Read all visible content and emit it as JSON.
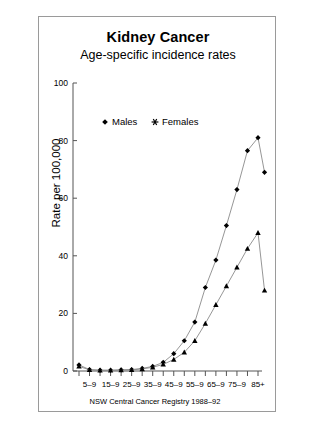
{
  "figure": {
    "title": "Kidney Cancer",
    "subtitle": "Age-specific incidence rates",
    "ylabel": "Rate per 100,000",
    "source_note": "NSW Central Cancer Registry 1988–92"
  },
  "legend": {
    "position": "top-left-inside",
    "entries": [
      {
        "label": "Males",
        "marker": "diamond-marker-icon",
        "color": "#000000"
      },
      {
        "label": "Females",
        "marker": "star-marker-icon",
        "color": "#000000"
      }
    ]
  },
  "chart_data": {
    "type": "line",
    "title": "Kidney Cancer",
    "subtitle": "Age-specific incidence rates",
    "xlabel": "",
    "ylabel": "Rate per 100,000",
    "ylim": [
      0,
      100
    ],
    "yticks": [
      0,
      20,
      40,
      60,
      80,
      100
    ],
    "ytick_labels": [
      "0",
      "20",
      "40",
      "60",
      "80",
      "100"
    ],
    "grid": false,
    "legend_position": "upper left",
    "categories": [
      "0–4",
      "5–9",
      "10–14",
      "15–19",
      "20–24",
      "25–29",
      "30–34",
      "35–39",
      "40–44",
      "45–49",
      "50–54",
      "55–59",
      "60–64",
      "65–69",
      "70–74",
      "75–79",
      "80–84",
      "85+"
    ],
    "xtick_labels_shown": [
      "",
      "5–9",
      "",
      "15–9",
      "",
      "25–9",
      "",
      "35–9",
      "",
      "45–9",
      "",
      "55–9",
      "",
      "65–9",
      "",
      "75–9",
      "",
      "85+"
    ],
    "series": [
      {
        "name": "Males",
        "marker": "diamond",
        "values": [
          2.1,
          0.5,
          0.3,
          0.3,
          0.4,
          0.5,
          0.9,
          1.6,
          3.0,
          6.0,
          10.5,
          17.0,
          29.0,
          38.5,
          50.5,
          63.0,
          76.5,
          81.0
        ]
      },
      {
        "name": "Females",
        "marker": "triangle",
        "values": [
          1.6,
          0.4,
          0.2,
          0.2,
          0.3,
          0.4,
          0.7,
          1.3,
          2.3,
          4.0,
          6.5,
          10.5,
          16.5,
          23.0,
          29.5,
          36.0,
          42.5,
          48.0
        ]
      }
    ],
    "series_tail": [
      {
        "name": "Males",
        "final_value": 69.0
      },
      {
        "name": "Females",
        "final_value": 28.0
      }
    ]
  }
}
